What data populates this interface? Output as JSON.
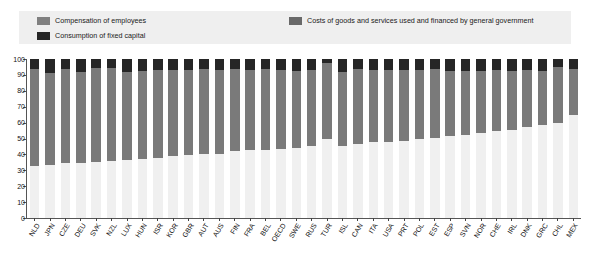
{
  "legend": {
    "entries": [
      {
        "label": "Compensation of employees",
        "color": "#808080",
        "name": "legend-compensation"
      },
      {
        "label": "Consumption of fixed capital",
        "color": "#262626",
        "name": "legend-fixed-capital"
      },
      {
        "label": "Costs of goods and services used and financed by general government",
        "color": "#696969",
        "name": "legend-goods-services"
      }
    ],
    "panel_color": "#efefef"
  },
  "chart_data": {
    "type": "bar",
    "stacked": true,
    "title": "",
    "subtitle": "",
    "xlabel": "",
    "ylabel": "",
    "ylim": [
      0,
      100
    ],
    "yticks": [
      0,
      10,
      20,
      30,
      40,
      50,
      60,
      70,
      80,
      90,
      100
    ],
    "grid": true,
    "legend_position": "top",
    "categories": [
      "NLD",
      "JPN",
      "CZE",
      "DEU",
      "SVK",
      "NZL",
      "LUX",
      "HUN",
      "ISR",
      "KOR",
      "GBR",
      "AUT",
      "AUS",
      "FIN",
      "FRA",
      "BEL",
      "OECD",
      "SWE",
      "RUS",
      "TUR",
      "ISL",
      "CAN",
      "ITA",
      "USA",
      "PRT",
      "POL",
      "EST",
      "ESP",
      "SVN",
      "NOR",
      "CHE",
      "IRL",
      "DNK",
      "GRC",
      "CHL",
      "MEX"
    ],
    "series": [
      {
        "name": "Compensation of employees",
        "color": "#f0f0f0",
        "values": [
          33.0,
          33.5,
          34.5,
          34.5,
          35.5,
          36.0,
          36.5,
          37.0,
          38.0,
          39.0,
          39.5,
          40.0,
          40.5,
          42.0,
          42.5,
          43.0,
          43.5,
          44.0,
          45.0,
          50.0,
          45.5,
          46.5,
          47.5,
          48.0,
          48.5,
          49.5,
          50.5,
          51.5,
          52.5,
          53.5,
          54.5,
          55.5,
          57.0,
          58.5,
          60.0,
          64.5
        ]
      },
      {
        "name": "Costs of goods and services used and financed by general government",
        "color": "#7a7a7a",
        "values": [
          61.0,
          57.5,
          59.5,
          57.5,
          59.0,
          58.5,
          55.5,
          55.5,
          55.0,
          54.0,
          53.5,
          53.5,
          52.5,
          52.0,
          50.5,
          50.5,
          49.5,
          48.5,
          48.0,
          47.5,
          46.5,
          47.0,
          45.5,
          45.0,
          44.5,
          43.5,
          43.0,
          41.0,
          40.0,
          39.0,
          38.5,
          37.0,
          36.0,
          34.0,
          35.0,
          29.5
        ]
      },
      {
        "name": "Consumption of fixed capital",
        "color": "#262626",
        "values": [
          6.0,
          9.0,
          6.0,
          8.0,
          5.5,
          5.5,
          8.0,
          7.5,
          7.0,
          7.0,
          7.0,
          6.5,
          7.0,
          6.0,
          7.0,
          6.5,
          7.0,
          7.5,
          7.0,
          2.5,
          8.0,
          6.5,
          7.0,
          7.0,
          7.0,
          7.0,
          6.5,
          7.5,
          7.5,
          7.5,
          7.0,
          7.5,
          7.0,
          7.5,
          5.0,
          6.0
        ]
      }
    ]
  }
}
